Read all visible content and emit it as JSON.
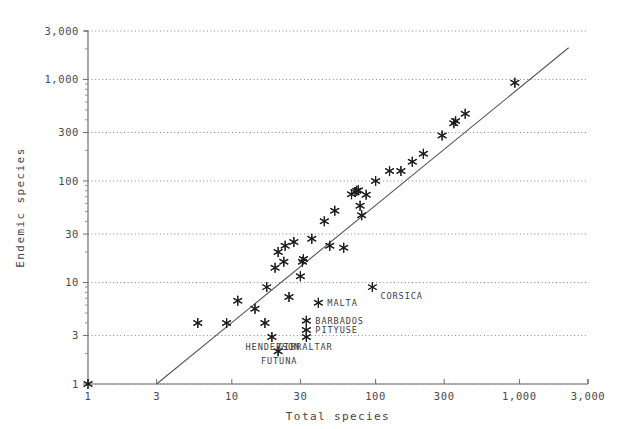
{
  "chart_data": {
    "type": "scatter",
    "title": "",
    "subtitle": "",
    "xlabel": "Total species",
    "ylabel": "Endemic species",
    "xscale": "log",
    "yscale": "log",
    "xlim": [
      1,
      3000
    ],
    "ylim": [
      1,
      3000
    ],
    "grid": true,
    "grid_axis": "y",
    "legend": "none",
    "xticks": [
      1,
      3,
      10,
      30,
      100,
      300,
      1000,
      3000
    ],
    "xticklabels": [
      "1",
      "3",
      "10",
      "30",
      "100",
      "300",
      "1,000",
      "3,000"
    ],
    "yticks": [
      1,
      3,
      10,
      30,
      100,
      300,
      1000,
      3000
    ],
    "yticklabels": [
      "1",
      "3",
      "10",
      "30",
      "100",
      "300",
      "1,000",
      "3,000"
    ],
    "reference_line": {
      "label": "regression line",
      "x_start": 3.0,
      "y_start": 1.0,
      "x_end": 2200,
      "y_end": 2050
    },
    "points": [
      {
        "x": 1,
        "y": 1,
        "label": ""
      },
      {
        "x": 5.8,
        "y": 4,
        "label": ""
      },
      {
        "x": 9.2,
        "y": 4,
        "label": ""
      },
      {
        "x": 11,
        "y": 6.6,
        "label": ""
      },
      {
        "x": 14.5,
        "y": 5.5,
        "label": ""
      },
      {
        "x": 17,
        "y": 4,
        "label": ""
      },
      {
        "x": 19,
        "y": 2.9,
        "label": "HENDERSON"
      },
      {
        "x": 21,
        "y": 2.1,
        "label": "FUTUNA"
      },
      {
        "x": 17.5,
        "y": 9,
        "label": ""
      },
      {
        "x": 20,
        "y": 14,
        "label": ""
      },
      {
        "x": 21,
        "y": 20,
        "label": ""
      },
      {
        "x": 23,
        "y": 16,
        "label": ""
      },
      {
        "x": 23.5,
        "y": 23,
        "label": ""
      },
      {
        "x": 25,
        "y": 7.2,
        "label": ""
      },
      {
        "x": 27,
        "y": 25,
        "label": ""
      },
      {
        "x": 30,
        "y": 11.5,
        "label": ""
      },
      {
        "x": 31,
        "y": 16,
        "label": ""
      },
      {
        "x": 31.5,
        "y": 17,
        "label": ""
      },
      {
        "x": 33,
        "y": 2.9,
        "label": "GIBRALTAR"
      },
      {
        "x": 33,
        "y": 3.4,
        "label": "PITYUSE"
      },
      {
        "x": 33,
        "y": 4.2,
        "label": "BARBADOS"
      },
      {
        "x": 36,
        "y": 27,
        "label": ""
      },
      {
        "x": 40,
        "y": 6.3,
        "label": "MALTA"
      },
      {
        "x": 44,
        "y": 40,
        "label": ""
      },
      {
        "x": 48,
        "y": 23,
        "label": ""
      },
      {
        "x": 52,
        "y": 51,
        "label": ""
      },
      {
        "x": 60,
        "y": 22,
        "label": ""
      },
      {
        "x": 68,
        "y": 74,
        "label": ""
      },
      {
        "x": 72,
        "y": 78,
        "label": ""
      },
      {
        "x": 74,
        "y": 80,
        "label": ""
      },
      {
        "x": 76,
        "y": 81,
        "label": ""
      },
      {
        "x": 78,
        "y": 57,
        "label": ""
      },
      {
        "x": 80,
        "y": 46,
        "label": ""
      },
      {
        "x": 86,
        "y": 73,
        "label": ""
      },
      {
        "x": 95,
        "y": 9,
        "label": "CORSICA"
      },
      {
        "x": 100,
        "y": 100,
        "label": ""
      },
      {
        "x": 125,
        "y": 125,
        "label": ""
      },
      {
        "x": 150,
        "y": 125,
        "label": ""
      },
      {
        "x": 180,
        "y": 155,
        "label": ""
      },
      {
        "x": 215,
        "y": 185,
        "label": ""
      },
      {
        "x": 290,
        "y": 280,
        "label": ""
      },
      {
        "x": 350,
        "y": 370,
        "label": ""
      },
      {
        "x": 360,
        "y": 390,
        "label": ""
      },
      {
        "x": 420,
        "y": 460,
        "label": ""
      },
      {
        "x": 930,
        "y": 930,
        "label": ""
      }
    ]
  }
}
